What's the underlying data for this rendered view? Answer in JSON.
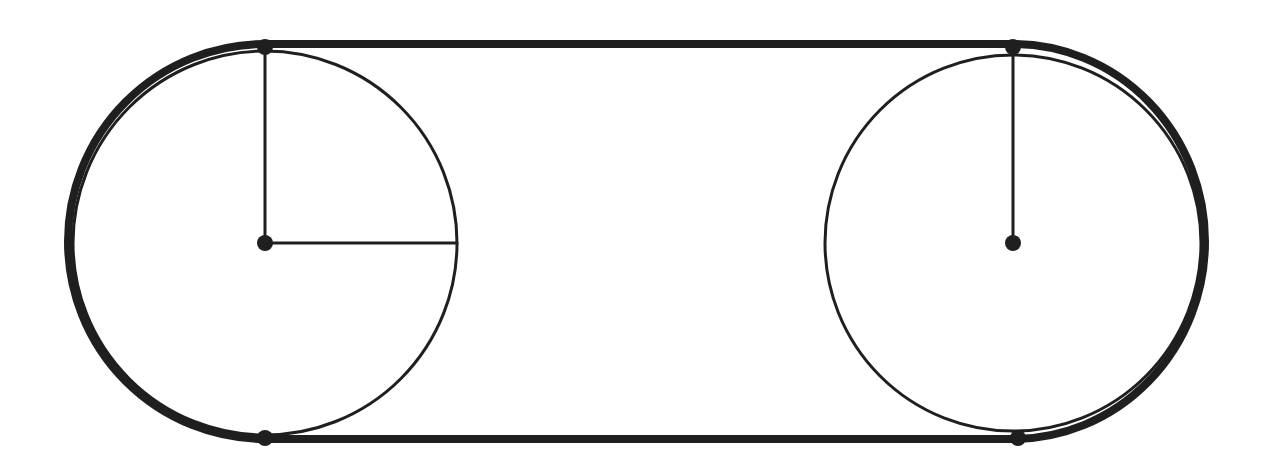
{
  "diagram": {
    "stroke_color": "#1f1f1f",
    "background": "#ffffff",
    "left_pulley": {
      "cx": 265,
      "cy": 243,
      "r": 192
    },
    "right_pulley": {
      "cx": 1013,
      "cy": 243,
      "r": 188
    },
    "belt": {
      "top_y": 44,
      "bottom_y": 439,
      "left_x": 265,
      "right_x": 1013,
      "stroke_width": 8
    },
    "points": [
      {
        "name": "left-center",
        "x": 265,
        "y": 243
      },
      {
        "name": "left-top-tangent",
        "x": 265,
        "y": 47
      },
      {
        "name": "left-bottom-tangent",
        "x": 265,
        "y": 438
      },
      {
        "name": "right-center",
        "x": 1013,
        "y": 243
      },
      {
        "name": "right-top-tangent",
        "x": 1013,
        "y": 47
      },
      {
        "name": "right-bottom-tangent",
        "x": 1018,
        "y": 438
      }
    ],
    "radii": [
      {
        "name": "left-vertical-radius",
        "x1": 265,
        "y1": 243,
        "x2": 265,
        "y2": 47
      },
      {
        "name": "left-horizontal-radius",
        "x1": 265,
        "y1": 243,
        "x2": 457,
        "y2": 243
      },
      {
        "name": "right-vertical-radius",
        "x1": 1013,
        "y1": 243,
        "x2": 1013,
        "y2": 47
      }
    ]
  }
}
